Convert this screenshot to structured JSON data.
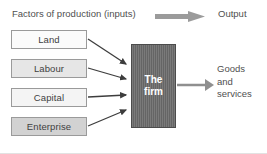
{
  "diagram": {
    "title_row": {
      "inputs_label": "Factors of production (inputs)",
      "output_label": "Output",
      "arrow_icon": "block-arrow-right-icon"
    },
    "factors": [
      {
        "id": "land",
        "label": "Land",
        "fill": "#fbfbfb"
      },
      {
        "id": "labour",
        "label": "Labour",
        "fill": "#e6e6e6"
      },
      {
        "id": "capital",
        "label": "Capital",
        "fill": "#f4f4f4"
      },
      {
        "id": "enterprise",
        "label": "Enterprise",
        "fill": "#d2d2d2"
      }
    ],
    "firm": {
      "line1": "The",
      "line2": "firm",
      "fill": "#6e6e6e",
      "text_color": "#ffffff"
    },
    "output": {
      "line1": "Goods",
      "line2": "and",
      "line3": "services",
      "arrow_icon": "arrow-right-icon"
    },
    "input_arrows": [
      {
        "from": "land",
        "to": "firm",
        "icon": "arrow-right-icon"
      },
      {
        "from": "labour",
        "to": "firm",
        "icon": "arrow-right-icon"
      },
      {
        "from": "capital",
        "to": "firm",
        "icon": "arrow-right-icon"
      },
      {
        "from": "enterprise",
        "to": "firm",
        "icon": "arrow-right-icon"
      }
    ],
    "colors": {
      "arrow": "#3d3d3d",
      "header_arrow": "#9b9b9b",
      "text": "#4f4f4f",
      "border": "#9a9a9a"
    }
  }
}
